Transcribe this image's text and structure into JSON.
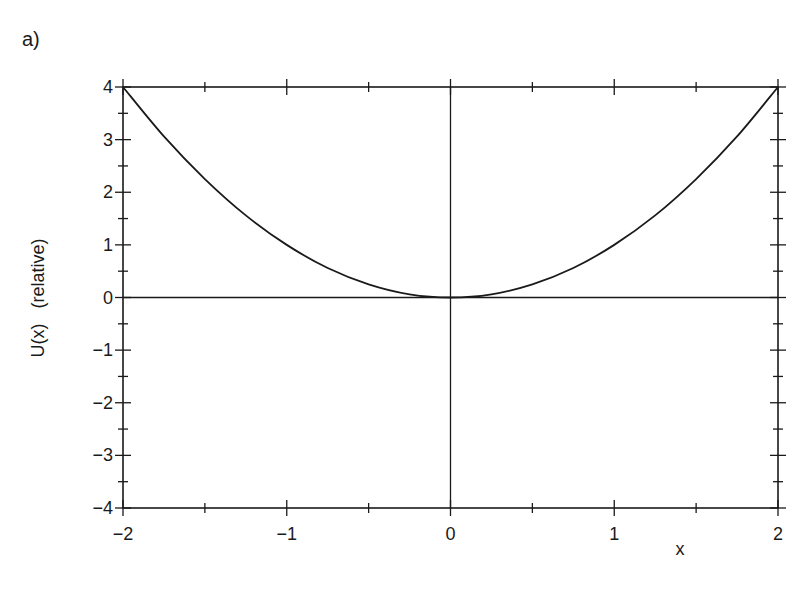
{
  "panel_label": "a)",
  "chart_data": {
    "type": "line",
    "title": "",
    "xlabel": "x",
    "ylabel": "U(x)   (relative)",
    "xlim": [
      -2,
      2
    ],
    "ylim": [
      -4,
      4
    ],
    "x_ticks": [
      -2,
      -1,
      0,
      1,
      2
    ],
    "x_tick_labels": [
      "−2",
      "−1",
      "0",
      "1",
      "2"
    ],
    "y_ticks": [
      -4,
      -3,
      -2,
      -1,
      0,
      1,
      2,
      3,
      4
    ],
    "y_tick_labels": [
      "−4",
      "−3",
      "−2",
      "−1",
      "0",
      "1",
      "2",
      "3",
      "4"
    ],
    "minor_x_step": 0.5,
    "minor_y_step": 0.5,
    "grid": false,
    "zero_lines": true,
    "series": [
      {
        "name": "U(x) = x^2",
        "x": [
          -2,
          -1.75,
          -1.5,
          -1.25,
          -1,
          -0.75,
          -0.5,
          -0.25,
          0,
          0.25,
          0.5,
          0.75,
          1,
          1.25,
          1.5,
          1.75,
          2
        ],
        "values": [
          4,
          3.06,
          2.25,
          1.56,
          1,
          0.56,
          0.25,
          0.06,
          0,
          0.06,
          0.25,
          0.56,
          1,
          1.56,
          2.25,
          3.06,
          4
        ]
      }
    ],
    "colors": {
      "line": "#1a1a1a",
      "background": "#ffffff"
    }
  }
}
